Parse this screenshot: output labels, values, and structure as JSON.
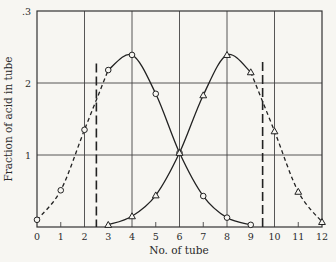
{
  "chart_data": {
    "type": "line",
    "title": "",
    "xlabel": "No. of tube",
    "ylabel": "Fraction of acid in tube",
    "xlim": [
      0,
      12
    ],
    "ylim": [
      0,
      3
    ],
    "x_ticks": [
      "0",
      "1",
      "2",
      "3",
      "4",
      "5",
      "6",
      "7",
      "8",
      "9",
      "10",
      "11",
      "12"
    ],
    "y_ticks": [
      {
        "value": 1,
        "label": "1"
      },
      {
        "value": 2,
        "label": "2"
      },
      {
        "value": 3,
        "label": ".3"
      }
    ],
    "grid": {
      "vertical_at": [
        2,
        4,
        6,
        8,
        10
      ],
      "horizontal_at": [
        1,
        2
      ]
    },
    "minor_x_ticks_at": [
      1,
      3,
      5,
      7,
      9,
      11
    ],
    "x": [
      0,
      1,
      2,
      3,
      4,
      5,
      6,
      7,
      8,
      9,
      10,
      11,
      12
    ],
    "series": [
      {
        "name": "Acid A (circles)",
        "marker": "circle",
        "x": [
          0,
          1,
          2,
          3,
          4,
          5,
          6,
          7,
          8,
          9
        ],
        "values": [
          0.1,
          0.51,
          1.35,
          2.18,
          2.39,
          1.85,
          1.03,
          0.43,
          0.13,
          0.03
        ],
        "dashed_until_x": 3
      },
      {
        "name": "Acid B (triangles)",
        "marker": "triangle",
        "x": [
          3,
          4,
          5,
          6,
          7,
          8,
          9,
          10,
          11,
          12
        ],
        "values": [
          0.03,
          0.15,
          0.44,
          1.03,
          1.83,
          2.39,
          2.15,
          1.33,
          0.49,
          0.07
        ],
        "dashed_from_x": 9
      }
    ],
    "cut_lines": [
      {
        "x": 2.5,
        "y_top": 2.27,
        "style": "long-dash"
      },
      {
        "x": 9.5,
        "y_top": 2.29,
        "style": "long-dash"
      }
    ]
  }
}
